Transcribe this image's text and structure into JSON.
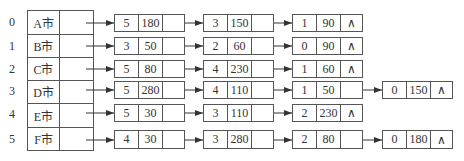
{
  "diagram": {
    "type": "adjacency-list",
    "null_symbol": "∧",
    "rows": [
      {
        "index": "0",
        "name": "A市",
        "edges": [
          {
            "v": "5",
            "w": "180"
          },
          {
            "v": "3",
            "w": "150"
          },
          {
            "v": "1",
            "w": "90"
          }
        ]
      },
      {
        "index": "1",
        "name": "B市",
        "edges": [
          {
            "v": "3",
            "w": "50"
          },
          {
            "v": "2",
            "w": "60"
          },
          {
            "v": "0",
            "w": "90"
          }
        ]
      },
      {
        "index": "2",
        "name": "C市",
        "edges": [
          {
            "v": "5",
            "w": "80"
          },
          {
            "v": "4",
            "w": "230"
          },
          {
            "v": "1",
            "w": "60"
          }
        ]
      },
      {
        "index": "3",
        "name": "D市",
        "edges": [
          {
            "v": "5",
            "w": "280"
          },
          {
            "v": "4",
            "w": "110"
          },
          {
            "v": "1",
            "w": "50"
          },
          {
            "v": "0",
            "w": "150"
          }
        ]
      },
      {
        "index": "4",
        "name": "E市",
        "edges": [
          {
            "v": "5",
            "w": "30"
          },
          {
            "v": "3",
            "w": "110"
          },
          {
            "v": "2",
            "w": "230"
          }
        ]
      },
      {
        "index": "5",
        "name": "F市",
        "edges": [
          {
            "v": "4",
            "w": "30"
          },
          {
            "v": "3",
            "w": "280"
          },
          {
            "v": "2",
            "w": "80"
          },
          {
            "v": "0",
            "w": "180"
          }
        ]
      }
    ]
  }
}
